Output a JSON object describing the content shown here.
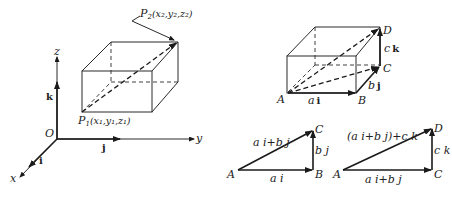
{
  "figure": {
    "left": {
      "axes": {
        "origin_label": "O",
        "x_label": "x",
        "y_label": "y",
        "z_label": "z",
        "i_label": "i",
        "j_label": "j",
        "k_label": "k"
      },
      "points": {
        "p1_label": "P",
        "p1_sub": "1",
        "p1_coords": "(x₁,y₁,z₁)",
        "p2_label": "P",
        "p2_sub": "2",
        "p2_coords": "(x₂,y₂,z₂)"
      }
    },
    "right_box": {
      "A": "A",
      "B": "B",
      "C": "C",
      "D": "D",
      "ai": "a",
      "ai_vec": "i",
      "bj": "b",
      "bj_vec": "j",
      "ck": "c",
      "ck_vec": "k"
    },
    "triangle_abc": {
      "A": "A",
      "B": "B",
      "C": "C",
      "base": "a i",
      "vertical": "b j",
      "hypotenuse": "a i+b j"
    },
    "triangle_acd": {
      "A": "A",
      "C": "C",
      "D": "D",
      "base": "a i+b j",
      "vertical": "c k",
      "hypotenuse": "(a i+b j)+c k"
    }
  },
  "colors": {
    "ink": "#1a1a1a",
    "background": "#ffffff"
  }
}
